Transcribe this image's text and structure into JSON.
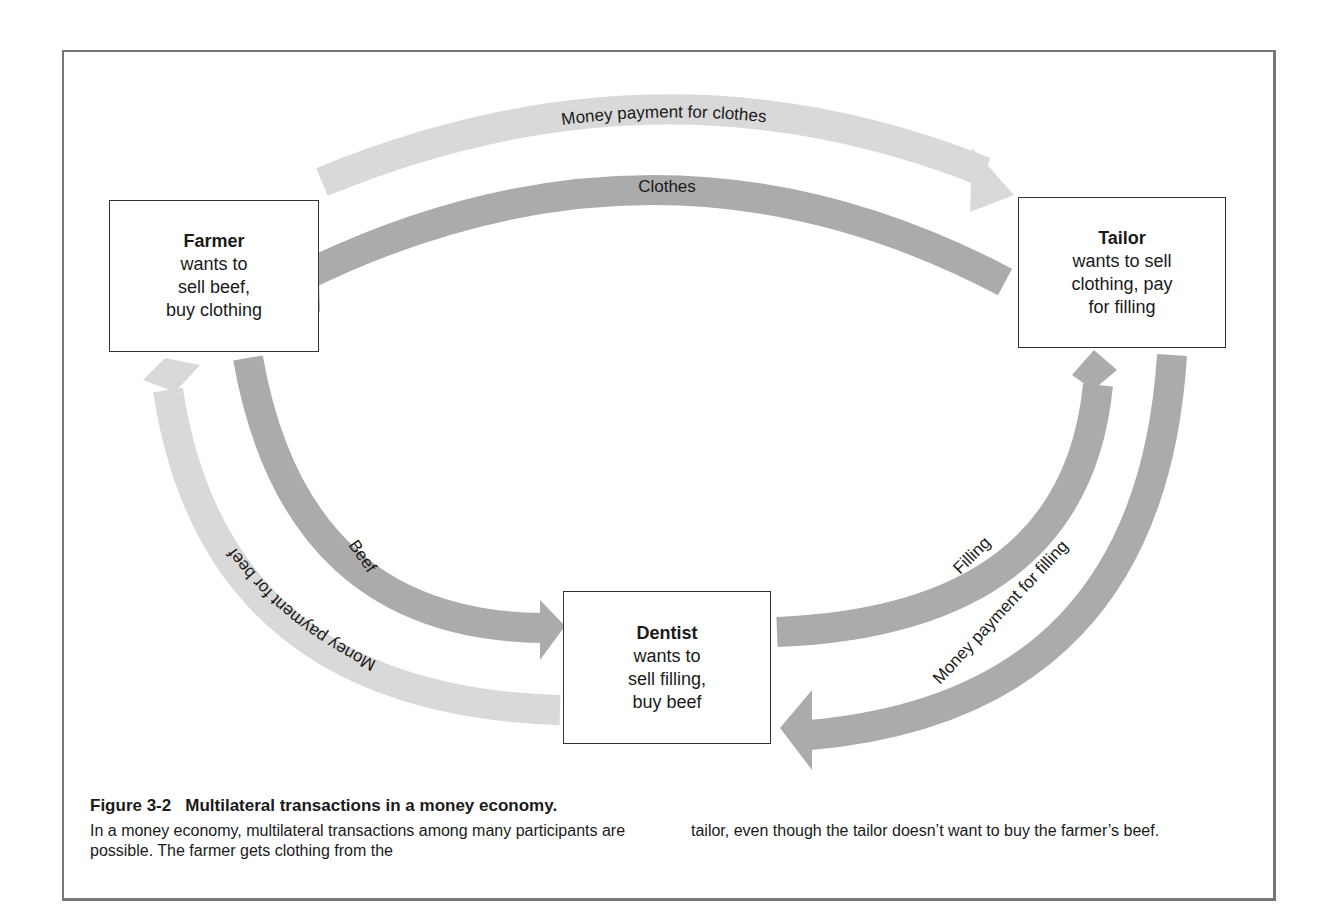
{
  "figure": {
    "number": "Figure 3-2",
    "title": "Multilateral transactions in a money economy.",
    "caption_col1": "In a money economy, multilateral transactions among many participants are possible. The farmer gets clothing from the",
    "caption_col2": "tailor, even though the tailor doesn’t want to buy the farmer’s beef."
  },
  "nodes": {
    "farmer": {
      "title": "Farmer",
      "desc": "wants to\nsell beef,\nbuy clothing"
    },
    "tailor": {
      "title": "Tailor",
      "desc": "wants to sell\nclothing, pay\nfor filling"
    },
    "dentist": {
      "title": "Dentist",
      "desc": "wants to\nsell filling,\nbuy beef"
    }
  },
  "flows": {
    "money_for_clothes": {
      "label": "Money payment for clothes",
      "from": "Farmer",
      "to": "Tailor",
      "kind": "money"
    },
    "clothes": {
      "label": "Clothes",
      "from": "Tailor",
      "to": "Farmer",
      "kind": "goods"
    },
    "beef": {
      "label": "Beef",
      "from": "Farmer",
      "to": "Dentist",
      "kind": "goods"
    },
    "money_for_beef": {
      "label": "Money payment for beef",
      "from": "Dentist",
      "to": "Farmer",
      "kind": "money"
    },
    "filling": {
      "label": "Filling",
      "from": "Dentist",
      "to": "Tailor",
      "kind": "goods"
    },
    "money_for_filling": {
      "label": "Money payment for filling",
      "from": "Tailor",
      "to": "Dentist",
      "kind": "goods"
    }
  },
  "colors": {
    "money_arrow": "#d9d9d9",
    "goods_arrow": "#a9a9a9",
    "box_border": "#333333",
    "frame_border": "#777777"
  }
}
